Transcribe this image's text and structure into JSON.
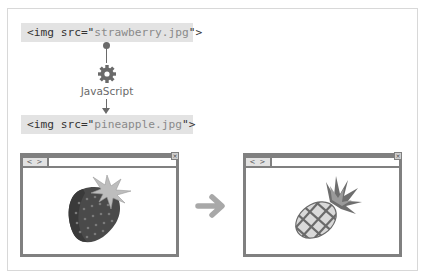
{
  "diagram": {
    "code_before": {
      "prefix": "<img src=\"",
      "value": "strawberry.jpg",
      "suffix": "\">"
    },
    "code_after": {
      "prefix": "<img src=\"",
      "value": "pineapple.jpg",
      "suffix": "\">"
    },
    "process_label": "JavaScript",
    "process_icon": "gear-icon",
    "transition_icon": "arrow-right-icon",
    "browser_before": {
      "nav": "< >",
      "close": "×",
      "image": "strawberry"
    },
    "browser_after": {
      "nav": "< >",
      "close": "×",
      "image": "pineapple"
    }
  },
  "colors": {
    "line": "#6a6a6a",
    "code_bg": "#e3e3e3",
    "window_border": "#808080",
    "arrow": "#a8a8a8"
  }
}
